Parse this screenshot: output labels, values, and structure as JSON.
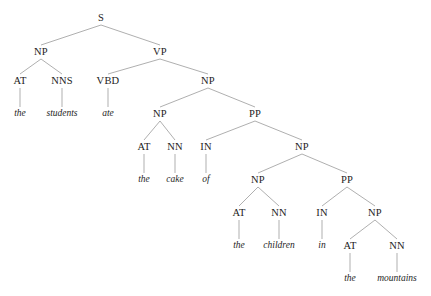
{
  "figure": {
    "kind": "constituency-parse-tree",
    "sentence": "the students ate the cake of the children in the mountains",
    "background_color": "#ffffff",
    "edge_color": "#8c8c8c",
    "text_color": "#1c1c1c"
  },
  "nodes": [
    {
      "id": "n0",
      "label": "S",
      "type": "nonterminal",
      "x": 101,
      "y": 18,
      "depth": 0
    },
    {
      "id": "n1",
      "label": "NP",
      "type": "nonterminal",
      "x": 41,
      "y": 52,
      "depth": 1
    },
    {
      "id": "n2",
      "label": "VP",
      "type": "nonterminal",
      "x": 160,
      "y": 52,
      "depth": 1
    },
    {
      "id": "n3",
      "label": "AT",
      "type": "nonterminal",
      "x": 20,
      "y": 81,
      "depth": 2
    },
    {
      "id": "n4",
      "label": "NNS",
      "type": "nonterminal",
      "x": 62,
      "y": 81,
      "depth": 2
    },
    {
      "id": "n5",
      "label": "VBD",
      "type": "nonterminal",
      "x": 108,
      "y": 81,
      "depth": 2
    },
    {
      "id": "n6",
      "label": "NP",
      "type": "nonterminal",
      "x": 208,
      "y": 81,
      "depth": 2
    },
    {
      "id": "n7",
      "label": "the",
      "type": "terminal",
      "x": 20,
      "y": 114,
      "depth": 3
    },
    {
      "id": "n8",
      "label": "students",
      "type": "terminal",
      "x": 62,
      "y": 114,
      "depth": 3
    },
    {
      "id": "n9",
      "label": "ate",
      "type": "terminal",
      "x": 108,
      "y": 114,
      "depth": 3
    },
    {
      "id": "n10",
      "label": "NP",
      "type": "nonterminal",
      "x": 160,
      "y": 114,
      "depth": 3
    },
    {
      "id": "n11",
      "label": "PP",
      "type": "nonterminal",
      "x": 255,
      "y": 114,
      "depth": 3
    },
    {
      "id": "n12",
      "label": "AT",
      "type": "nonterminal",
      "x": 144,
      "y": 147,
      "depth": 4
    },
    {
      "id": "n13",
      "label": "NN",
      "type": "nonterminal",
      "x": 175,
      "y": 147,
      "depth": 4
    },
    {
      "id": "n14",
      "label": "IN",
      "type": "nonterminal",
      "x": 206,
      "y": 147,
      "depth": 4
    },
    {
      "id": "n15",
      "label": "NP",
      "type": "nonterminal",
      "x": 302,
      "y": 147,
      "depth": 4
    },
    {
      "id": "n16",
      "label": "the",
      "type": "terminal",
      "x": 144,
      "y": 180,
      "depth": 5
    },
    {
      "id": "n17",
      "label": "cake",
      "type": "terminal",
      "x": 175,
      "y": 180,
      "depth": 5
    },
    {
      "id": "n18",
      "label": "of",
      "type": "terminal",
      "x": 206,
      "y": 180,
      "depth": 5
    },
    {
      "id": "n19",
      "label": "NP",
      "type": "nonterminal",
      "x": 258,
      "y": 180,
      "depth": 5
    },
    {
      "id": "n20",
      "label": "PP",
      "type": "nonterminal",
      "x": 347,
      "y": 180,
      "depth": 5
    },
    {
      "id": "n21",
      "label": "AT",
      "type": "nonterminal",
      "x": 239,
      "y": 213,
      "depth": 6
    },
    {
      "id": "n22",
      "label": "NN",
      "type": "nonterminal",
      "x": 279,
      "y": 213,
      "depth": 6
    },
    {
      "id": "n23",
      "label": "IN",
      "type": "nonterminal",
      "x": 322,
      "y": 213,
      "depth": 6
    },
    {
      "id": "n24",
      "label": "NP",
      "type": "nonterminal",
      "x": 375,
      "y": 213,
      "depth": 6
    },
    {
      "id": "n25",
      "label": "the",
      "type": "terminal",
      "x": 239,
      "y": 246,
      "depth": 7
    },
    {
      "id": "n26",
      "label": "children",
      "type": "terminal",
      "x": 279,
      "y": 246,
      "depth": 7
    },
    {
      "id": "n27",
      "label": "in",
      "type": "terminal",
      "x": 322,
      "y": 246,
      "depth": 7
    },
    {
      "id": "n28",
      "label": "AT",
      "type": "nonterminal",
      "x": 350,
      "y": 246,
      "depth": 7
    },
    {
      "id": "n29",
      "label": "NN",
      "type": "nonterminal",
      "x": 397,
      "y": 246,
      "depth": 7
    },
    {
      "id": "n30",
      "label": "the",
      "type": "terminal",
      "x": 350,
      "y": 279,
      "depth": 8
    },
    {
      "id": "n31",
      "label": "mountains",
      "type": "terminal",
      "x": 397,
      "y": 279,
      "depth": 8
    }
  ],
  "edges": [
    {
      "from": "n0",
      "to": "n1"
    },
    {
      "from": "n0",
      "to": "n2"
    },
    {
      "from": "n1",
      "to": "n3"
    },
    {
      "from": "n1",
      "to": "n4"
    },
    {
      "from": "n2",
      "to": "n5"
    },
    {
      "from": "n2",
      "to": "n6"
    },
    {
      "from": "n3",
      "to": "n7"
    },
    {
      "from": "n4",
      "to": "n8"
    },
    {
      "from": "n5",
      "to": "n9"
    },
    {
      "from": "n6",
      "to": "n10"
    },
    {
      "from": "n6",
      "to": "n11"
    },
    {
      "from": "n10",
      "to": "n12"
    },
    {
      "from": "n10",
      "to": "n13"
    },
    {
      "from": "n11",
      "to": "n14"
    },
    {
      "from": "n11",
      "to": "n15"
    },
    {
      "from": "n12",
      "to": "n16"
    },
    {
      "from": "n13",
      "to": "n17"
    },
    {
      "from": "n14",
      "to": "n18"
    },
    {
      "from": "n15",
      "to": "n19"
    },
    {
      "from": "n15",
      "to": "n20"
    },
    {
      "from": "n19",
      "to": "n21"
    },
    {
      "from": "n19",
      "to": "n22"
    },
    {
      "from": "n20",
      "to": "n23"
    },
    {
      "from": "n20",
      "to": "n24"
    },
    {
      "from": "n21",
      "to": "n25"
    },
    {
      "from": "n22",
      "to": "n26"
    },
    {
      "from": "n23",
      "to": "n27"
    },
    {
      "from": "n24",
      "to": "n28"
    },
    {
      "from": "n24",
      "to": "n29"
    },
    {
      "from": "n28",
      "to": "n30"
    },
    {
      "from": "n29",
      "to": "n31"
    }
  ]
}
